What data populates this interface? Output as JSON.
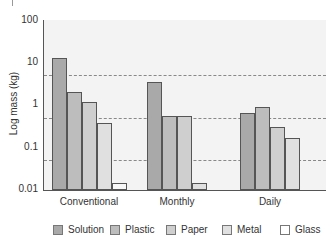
{
  "chart_data": {
    "type": "bar",
    "title": "",
    "xlabel": "",
    "ylabel": "Log mass (kg)",
    "yscale": "log",
    "ylim": [
      0.01,
      100
    ],
    "yticks": [
      "100",
      "10",
      "1",
      "0.1",
      "0.01"
    ],
    "grid": "dashed lines at 5, 0.5, 0.05",
    "legend_position": "bottom",
    "categories": [
      "Conventional",
      "Monthly",
      "Daily"
    ],
    "series": [
      {
        "name": "Solution",
        "color": "#a9a9a9",
        "values": [
          13,
          3.5,
          0.65
        ]
      },
      {
        "name": "Plastic",
        "color": "#bdbdbd",
        "values": [
          2.0,
          0.55,
          0.9
        ]
      },
      {
        "name": "Paper",
        "color": "#cfcfcf",
        "values": [
          1.2,
          0.55,
          0.3
        ]
      },
      {
        "name": "Metal",
        "color": "#e0e0e0",
        "values": [
          0.38,
          0.015,
          0.17
        ]
      },
      {
        "name": "Glass",
        "color": "#f8f8f8",
        "values": [
          0.015,
          null,
          null
        ]
      }
    ]
  },
  "axis": {
    "ylabel": "Log mass (kg)",
    "ticks": [
      "100",
      "10",
      "1",
      "0.1",
      "0.01"
    ]
  },
  "categories": [
    "Conventional",
    "Monthly",
    "Daily"
  ],
  "legend": [
    "Solution",
    "Plastic",
    "Paper",
    "Metal",
    "Glass"
  ]
}
